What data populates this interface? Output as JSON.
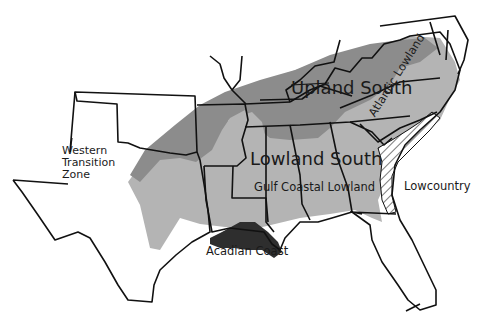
{
  "map": {
    "title": "Southern US Cultural Regions",
    "colors": {
      "background": "#ffffff",
      "upland_south": "#8c8c8c",
      "lowland_south": "#b4b4b4",
      "acadian_coast": "#2e2e2e",
      "border": "#111111",
      "text": "#1a1a1a"
    },
    "regions": [
      {
        "id": "upland-south",
        "label": "Upland South"
      },
      {
        "id": "lowland-south",
        "label": "Lowland South"
      },
      {
        "id": "gulf-coastal-lowland",
        "label": "Gulf Coastal Lowland"
      },
      {
        "id": "atlantic-lowland",
        "label": "Atlantic Lowland"
      },
      {
        "id": "lowcountry",
        "label": "Lowcountry"
      },
      {
        "id": "acadian-coast",
        "label": "Acadian Coast"
      },
      {
        "id": "western-transition-zone",
        "label": "Western\nTransition\nZone"
      }
    ]
  }
}
